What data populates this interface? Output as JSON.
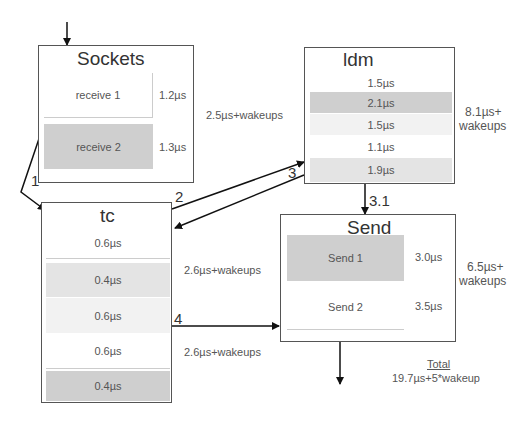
{
  "sockets": {
    "title": "Sockets",
    "items": [
      {
        "label": "receive 1",
        "time": "1.2µs"
      },
      {
        "label": "receive 2",
        "time": "1.3µs"
      }
    ],
    "total": "2.5µs+wakeups"
  },
  "ldm": {
    "title": "ldm",
    "rows": [
      "1.5µs",
      "2.1µs",
      "1.5µs",
      "1.1µs",
      "1.9µs"
    ],
    "total_line1": "8.1µs+",
    "total_line2": "wakeups"
  },
  "tc": {
    "title": "tc",
    "rows": [
      "0.6µs",
      "0.4µs",
      "0.6µs",
      "0.6µs",
      "0.4µs"
    ],
    "total_a": "2.6µs+wakeups",
    "total_b": "2.6µs+wakeups"
  },
  "send": {
    "title": "Send",
    "items": [
      {
        "label": "Send 1",
        "time": "3.0µs"
      },
      {
        "label": "Send 2",
        "time": "3.5µs"
      }
    ],
    "total_line1": "6.5µs+",
    "total_line2": "wakeups"
  },
  "steps": {
    "s1": "1",
    "s2": "2",
    "s3": "3",
    "s31": "3.1",
    "s4": "4"
  },
  "total": {
    "heading": "Total",
    "value": "19.7µs+5*wakeup"
  }
}
